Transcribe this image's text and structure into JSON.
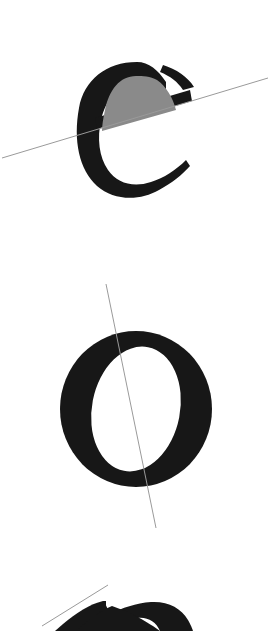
{
  "page": {
    "title": "Letterform stress axis figure",
    "background_color": "#ffffff",
    "width": 269,
    "height": 631,
    "media": "scanned print page"
  },
  "palette": {
    "ink": "#171717",
    "shaded_counter": "#8a8a8a",
    "axis_line": "#9a9a9a",
    "paper": "#ffffff"
  },
  "figures": [
    {
      "id": "figure-e-top",
      "glyph": "e",
      "glyph_label": "e",
      "style": "serif lowercase e",
      "ink_color": "#171717",
      "has_shaded_counter": true,
      "shaded_counter_color": "#8a8a8a",
      "shaded_counter_name": "eye of the e",
      "bounds": {
        "x": 78,
        "y": 62,
        "width": 117,
        "height": 136
      },
      "axis": {
        "name": "bar-axis-line",
        "color": "#9a9a9a",
        "x1": 2,
        "y1": 158,
        "x2": 268,
        "y2": 78,
        "angle_degrees": -16.8,
        "orientation": "diagonal, rising to the right"
      }
    },
    {
      "id": "figure-o-middle",
      "glyph": "O",
      "glyph_label": "O",
      "style": "serif capital O",
      "ink_color": "#171717",
      "has_shaded_counter": false,
      "shaded_counter_color": null,
      "shaded_counter_name": null,
      "bounds": {
        "x": 60,
        "y": 331,
        "width": 152,
        "height": 156
      },
      "axis": {
        "name": "stress-axis-line",
        "color": "#9a9a9a",
        "x1": 106,
        "y1": 284,
        "x2": 156,
        "y2": 528,
        "angle_degrees": 78.4,
        "orientation": "near-vertical, inclined to the right"
      }
    },
    {
      "id": "figure-e-bottom-cropped",
      "glyph": "e",
      "glyph_label": "e",
      "style": "serif lowercase e, cropped by page edge",
      "ink_color": "#171717",
      "has_shaded_counter": false,
      "shaded_counter_color": null,
      "shaded_counter_name": null,
      "bounds": {
        "x": 40,
        "y": 600,
        "width": 150,
        "height": 31
      },
      "axis": {
        "name": "bar-axis-line",
        "color": "#9a9a9a",
        "x1": 42,
        "y1": 626,
        "x2": 108,
        "y2": 585,
        "angle_degrees": -31.8,
        "orientation": "diagonal, rising to the right"
      }
    }
  ]
}
